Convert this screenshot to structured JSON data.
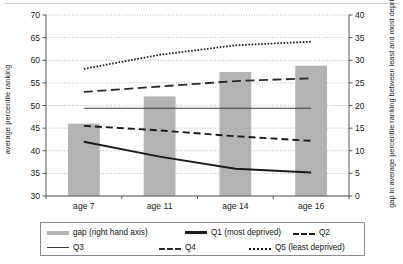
{
  "chart_data": {
    "type": "bar",
    "title": "",
    "subtitle": "",
    "categories": [
      "age 7",
      "age 11",
      "age 14",
      "age 16"
    ],
    "xlabel": "",
    "ylabel": "average percentile ranking",
    "ylabel_right": "gap in average percentile ranking between least and most deprived quintile groups",
    "ylim": [
      30,
      70
    ],
    "ylim_right": [
      0,
      40
    ],
    "yticks": [
      30,
      35,
      40,
      45,
      50,
      55,
      60,
      65,
      70
    ],
    "yticks_right": [
      0,
      5,
      10,
      15,
      20,
      25,
      30,
      35,
      40
    ],
    "grid": true,
    "legend_position": "bottom",
    "series": [
      {
        "name": "gap (right hand axis)",
        "type": "bar",
        "axis": "right",
        "color": "#b3b3b3",
        "values": [
          16.0,
          22.0,
          27.4,
          28.8
        ]
      },
      {
        "name": "Q1 (most deprived)",
        "type": "line",
        "axis": "left",
        "style": "solid-thick",
        "color": "#1a1a1a",
        "values": [
          42.0,
          38.7,
          36.0,
          35.2
        ]
      },
      {
        "name": "Q2",
        "type": "line",
        "axis": "left",
        "style": "dashed",
        "color": "#1a1a1a",
        "values": [
          45.5,
          44.5,
          43.2,
          42.2
        ]
      },
      {
        "name": "Q3",
        "type": "line",
        "axis": "left",
        "style": "solid-thin",
        "color": "#3a3a3a",
        "values": [
          49.4,
          49.4,
          49.4,
          49.4
        ]
      },
      {
        "name": "Q4",
        "type": "line",
        "axis": "left",
        "style": "dashed-long",
        "color": "#2a2a2a",
        "values": [
          53.0,
          54.2,
          55.4,
          56.0
        ]
      },
      {
        "name": "Q5 (least deprived)",
        "type": "line",
        "axis": "left",
        "style": "dotted",
        "color": "#1a1a1a",
        "values": [
          58.1,
          61.2,
          63.3,
          64.1
        ]
      }
    ]
  },
  "legend": {
    "items": [
      {
        "label": "gap (right hand axis)",
        "swatch": "gap-swatch"
      },
      {
        "label": "Q1 (most deprived)",
        "swatch": "q1-swatch"
      },
      {
        "label": "Q2",
        "swatch": "q2-swatch"
      },
      {
        "label": "Q3",
        "swatch": "q3-swatch"
      },
      {
        "label": "Q4",
        "swatch": "q4-swatch"
      },
      {
        "label": "Q5 (least deprived)",
        "swatch": "q5-swatch"
      }
    ]
  }
}
